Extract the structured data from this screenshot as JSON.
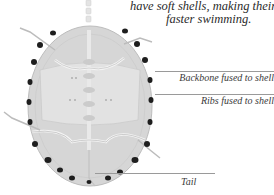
{
  "caption": {
    "line1": "have soft shells, making their bo",
    "line2": "faster swimming."
  },
  "labels": [
    {
      "id": "backbone",
      "text": "Backbone fused to shell"
    },
    {
      "id": "ribs",
      "text": "Ribs fused to shell"
    },
    {
      "id": "tail",
      "text": "Tail"
    }
  ],
  "illustration": {
    "subject": "turtle-skeleton-underside",
    "colors": {
      "shell": "#d6d6d6",
      "shell_edge": "#bdbdbd",
      "bone": "#f2f2f2",
      "spots": "#1e1e1e",
      "leader_line": "#9a9a9a"
    }
  }
}
